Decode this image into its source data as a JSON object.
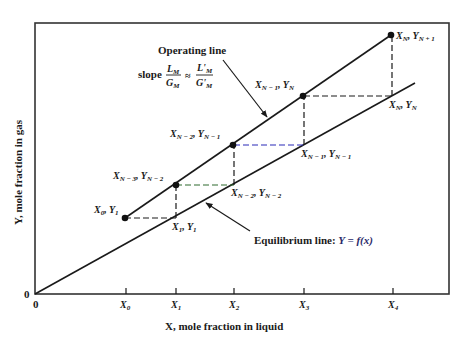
{
  "diagram": {
    "type": "mccabe-thiele-stage-construction",
    "axes": {
      "x_label": "X, mole fraction in liquid",
      "y_label": "Y, mole fraction in gas",
      "origin_x_label": "0",
      "origin_y_label": "0",
      "x_ticks": [
        "X0",
        "X1",
        "X2",
        "X3",
        "X4"
      ]
    },
    "operating_line": {
      "label": "Operating line",
      "slope_prefix": "slope",
      "slope_num": "L",
      "slope_num_sub": "M",
      "slope_den": "G",
      "slope_den_sub": "M",
      "approx": "≈",
      "slope2_num": "L'",
      "slope2_num_sub": "M",
      "slope2_den": "G'",
      "slope2_den_sub": "M"
    },
    "equilibrium_line": {
      "label": "Equilibrium line: ",
      "formula": "Y = f(x)"
    },
    "points_operating": [
      {
        "x": "X",
        "x_sub": "0",
        "y": "Y",
        "y_sub": "1"
      },
      {
        "x": "X",
        "x_sub": "N − 3",
        "y": "Y",
        "y_sub": "N − 2"
      },
      {
        "x": "X",
        "x_sub": "N − 2",
        "y": "Y",
        "y_sub": "N − 1"
      },
      {
        "x": "X",
        "x_sub": "N − 1",
        "y": "Y",
        "y_sub": "N"
      },
      {
        "x": "X",
        "x_sub": "N",
        "y": "Y",
        "y_sub": "N + 1"
      }
    ],
    "points_equilibrium": [
      {
        "x": "X",
        "x_sub": "1",
        "y": "Y",
        "y_sub": "1"
      },
      {
        "x": "X",
        "x_sub": "N − 2",
        "y": "Y",
        "y_sub": "N − 2"
      },
      {
        "x": "X",
        "x_sub": "N − 1",
        "y": "Y",
        "y_sub": "N − 1"
      },
      {
        "x": "X",
        "x_sub": "N",
        "y": "Y",
        "y_sub": "N"
      }
    ],
    "colors": {
      "line": "#1a1a1a",
      "step_dash_black": "#1a1a1a",
      "step_dash_green": "#2e6b2e",
      "step_dash_blue": "#2a2ab8"
    }
  }
}
